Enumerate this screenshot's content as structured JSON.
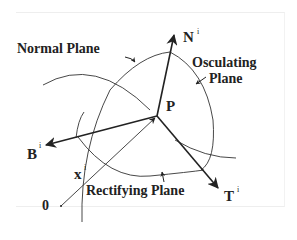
{
  "diagram": {
    "labels": {
      "normal_plane": "Normal Plane",
      "osculating_line1": "Osculating",
      "osculating_line2": "Plane",
      "rectifying_plane": "Rectifying Plane",
      "point": "P",
      "normal": "N",
      "binormal": "B",
      "tangent": "T",
      "position": "x",
      "origin": "0",
      "superscript": "i"
    },
    "colors": {
      "ink": "#222222",
      "background": "#ffffff"
    }
  }
}
